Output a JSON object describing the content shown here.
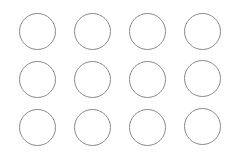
{
  "grid": {
    "rows": 3,
    "columns": 4,
    "stroke_color": "#8a8a8a",
    "fill": "none",
    "circles": [
      {
        "row": 1,
        "col": 1,
        "state": "empty"
      },
      {
        "row": 1,
        "col": 2,
        "state": "empty"
      },
      {
        "row": 1,
        "col": 3,
        "state": "empty"
      },
      {
        "row": 1,
        "col": 4,
        "state": "empty"
      },
      {
        "row": 2,
        "col": 1,
        "state": "empty"
      },
      {
        "row": 2,
        "col": 2,
        "state": "empty"
      },
      {
        "row": 2,
        "col": 3,
        "state": "empty"
      },
      {
        "row": 2,
        "col": 4,
        "state": "empty"
      },
      {
        "row": 3,
        "col": 1,
        "state": "empty"
      },
      {
        "row": 3,
        "col": 2,
        "state": "empty"
      },
      {
        "row": 3,
        "col": 3,
        "state": "empty"
      },
      {
        "row": 3,
        "col": 4,
        "state": "empty"
      }
    ]
  }
}
